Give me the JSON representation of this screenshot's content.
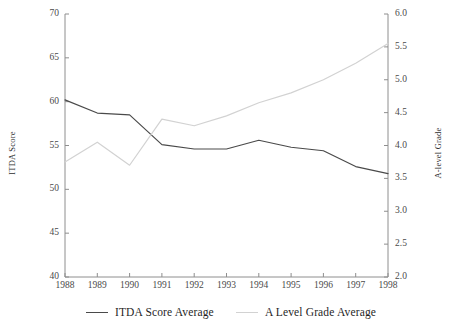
{
  "chart_data": {
    "type": "line",
    "title": "",
    "xlabel": "",
    "x": [
      1988,
      1989,
      1990,
      1991,
      1992,
      1993,
      1994,
      1995,
      1996,
      1997,
      1998
    ],
    "xtick_labels": [
      "1988",
      "1989",
      "1990",
      "1991",
      "1992",
      "1993",
      "1994",
      "1995",
      "1996",
      "1997",
      "1998"
    ],
    "grid": false,
    "legend_position": "bottom-center",
    "axes": [
      {
        "side": "left",
        "label": "ITDA Score",
        "ylim": [
          40,
          70
        ],
        "ticks": [
          40,
          45,
          50,
          55,
          60,
          65,
          70
        ],
        "tick_labels": [
          "40",
          "45",
          "50",
          "55",
          "60",
          "65",
          "70"
        ]
      },
      {
        "side": "right",
        "label": "A-level Grade",
        "ylim": [
          2.0,
          6.0
        ],
        "ticks": [
          2.0,
          2.5,
          3.0,
          3.5,
          4.0,
          4.5,
          5.0,
          5.5,
          6.0
        ],
        "tick_labels": [
          "2.0",
          "2.5",
          "3.0",
          "3.5",
          "4.0",
          "4.5",
          "5.0",
          "5.5",
          "6.0"
        ]
      }
    ],
    "series": [
      {
        "name": "ITDA Score Average",
        "axis": "left",
        "color": "#4a4a4a",
        "values": [
          60.2,
          58.7,
          58.5,
          55.1,
          54.6,
          54.6,
          55.6,
          54.8,
          54.4,
          52.6,
          51.8
        ]
      },
      {
        "name": "A Level Grade Average",
        "axis": "right",
        "color": "#d2d2d2",
        "values": [
          3.75,
          4.05,
          3.7,
          4.4,
          4.3,
          4.45,
          4.65,
          4.8,
          5.0,
          5.25,
          5.55
        ]
      }
    ]
  },
  "legend": {
    "items": [
      {
        "label": "ITDA Score Average",
        "color": "#4a4a4a"
      },
      {
        "label": "A Level Grade Average",
        "color": "#d2d2d2"
      }
    ]
  }
}
